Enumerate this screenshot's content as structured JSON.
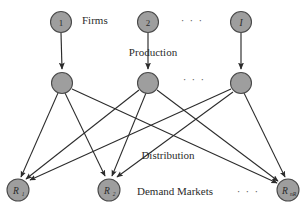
{
  "figure": {
    "background_color": "#ffffff",
    "node_fill_color": "#9e9e9e",
    "node_stroke_color": "#4a4a4a",
    "edge_color": "#2b2b2b",
    "text_color": "#2b2b2b"
  },
  "tiers": {
    "firms_label": "Firms",
    "production_label": "Production",
    "distribution_label": "Distribution",
    "demand_markets_label": "Demand Markets"
  },
  "ellipses": {
    "top_row": "· · ·",
    "middle_row": "· · ·",
    "bottom_row": "· · ·"
  },
  "nodes": {
    "firms": [
      {
        "id": "firm-1",
        "label": "1",
        "style": "plain",
        "cx": 61,
        "cy": 22,
        "r": 10.5
      },
      {
        "id": "firm-2",
        "label": "2",
        "style": "plain",
        "cx": 148,
        "cy": 22,
        "r": 10.5
      },
      {
        "id": "firm-I",
        "label": "I",
        "style": "italic",
        "cx": 241,
        "cy": 22,
        "r": 10.5
      }
    ],
    "manufacturing": [
      {
        "id": "plant-1",
        "label": "",
        "style": "none",
        "cx": 62,
        "cy": 83,
        "r": 10.5
      },
      {
        "id": "plant-2",
        "label": "",
        "style": "none",
        "cx": 148,
        "cy": 83,
        "r": 10.5
      },
      {
        "id": "plant-I",
        "label": "",
        "style": "none",
        "cx": 241,
        "cy": 83,
        "r": 10.5
      }
    ],
    "demand_markets": [
      {
        "id": "market-R1",
        "label": "R",
        "subscript": "1",
        "style": "italic",
        "cx": 18,
        "cy": 190,
        "r": 11
      },
      {
        "id": "market-R2",
        "label": "R",
        "subscript": "2",
        "style": "italic",
        "cx": 109,
        "cy": 190,
        "r": 11
      },
      {
        "id": "market-RnR",
        "label": "R",
        "subscript": "nR",
        "style": "italic",
        "cx": 288,
        "cy": 190,
        "r": 11
      }
    ]
  },
  "edges": {
    "production": [
      {
        "from": "firm-1",
        "to": "plant-1"
      },
      {
        "from": "firm-2",
        "to": "plant-2"
      },
      {
        "from": "firm-I",
        "to": "plant-I"
      }
    ],
    "distribution": [
      {
        "from": "plant-1",
        "to": "market-R1"
      },
      {
        "from": "plant-1",
        "to": "market-R2"
      },
      {
        "from": "plant-1",
        "to": "market-RnR"
      },
      {
        "from": "plant-2",
        "to": "market-R1"
      },
      {
        "from": "plant-2",
        "to": "market-R2"
      },
      {
        "from": "plant-2",
        "to": "market-RnR"
      },
      {
        "from": "plant-I",
        "to": "market-R1"
      },
      {
        "from": "plant-I",
        "to": "market-R2"
      },
      {
        "from": "plant-I",
        "to": "market-RnR"
      }
    ]
  },
  "captions": {
    "firms": {
      "text": "Firms",
      "x": 82,
      "y": 20,
      "anchor": "start"
    },
    "production": {
      "text": "Production",
      "x": 153,
      "y": 52,
      "anchor": "middle"
    },
    "distribution": {
      "text": "Distribution",
      "x": 168,
      "y": 155,
      "anchor": "middle"
    },
    "demand_markets": {
      "text": "Demand Markets",
      "x": 137,
      "y": 191,
      "anchor": "start"
    }
  },
  "ellipsis_positions": {
    "top": {
      "x": 192,
      "y": 20
    },
    "middle": {
      "x": 194,
      "y": 79
    },
    "bottom": {
      "x": 248,
      "y": 191
    }
  }
}
